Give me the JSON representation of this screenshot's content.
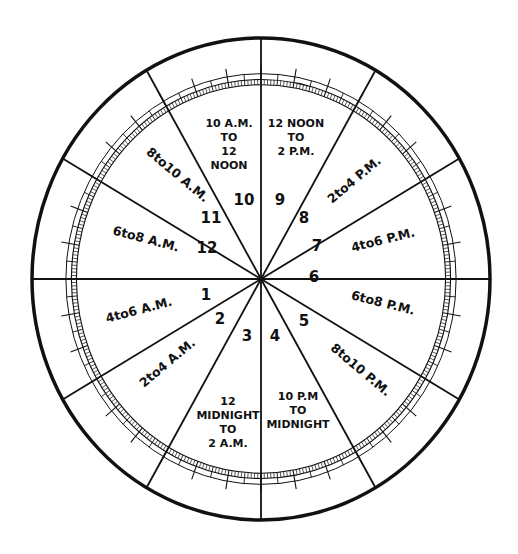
{
  "diagram": {
    "type": "astrological-house-wheel",
    "geometry": {
      "cx": 261,
      "cy": 279,
      "rx": 229,
      "ry": 241,
      "stroke_color": "#111111",
      "background": "#ffffff"
    },
    "houses": [
      {
        "number": "1",
        "time_lines": [
          "4 TO 6 A.M."
        ],
        "display": "4to6 A.M."
      },
      {
        "number": "2",
        "time_lines": [
          "2 TO 4 A.M."
        ],
        "display": "2to4 A.M."
      },
      {
        "number": "3",
        "time_lines": [
          "12",
          "MIDNIGHT",
          "TO",
          "2 A.M."
        ],
        "display": "12 MIDNIGHT TO 2 A.M."
      },
      {
        "number": "4",
        "time_lines": [
          "10 P.M",
          "TO",
          "MIDNIGHT"
        ],
        "display": "10 P.M TO MIDNIGHT"
      },
      {
        "number": "5",
        "time_lines": [
          "8 TO 10 P.M."
        ],
        "display": "8to10 P.M."
      },
      {
        "number": "6",
        "time_lines": [
          "6 TO 8 P.M."
        ],
        "display": "6to8 P.M."
      },
      {
        "number": "7",
        "time_lines": [
          "4 TO 6 P.M."
        ],
        "display": "4to6 P.M."
      },
      {
        "number": "8",
        "time_lines": [
          "2 TO 4 P.M."
        ],
        "display": "2to4 P.M."
      },
      {
        "number": "9",
        "time_lines": [
          "12 NOON",
          "TO",
          "2 P.M."
        ],
        "display": "12 NOON TO 2 P.M."
      },
      {
        "number": "10",
        "time_lines": [
          "10 A.M.",
          "TO",
          "12",
          "NOON"
        ],
        "display": "10 A.M. TO 12 NOON"
      },
      {
        "number": "11",
        "time_lines": [
          "8 TO 10 A.M."
        ],
        "display": "8to10 A.M."
      },
      {
        "number": "12",
        "time_lines": [
          "6 TO 8 A.M."
        ],
        "display": "6to8 A.M."
      }
    ],
    "labels": {
      "h1": {
        "text": "4to6 A.M.",
        "x": 140,
        "y": 314,
        "rot": -15
      },
      "h2": {
        "text": "2to4 A.M.",
        "x": 170,
        "y": 366,
        "rot": -40
      },
      "h3": {
        "lines": [
          "12",
          "MIDNIGHT",
          "TO",
          "2 A.M."
        ],
        "x": 228,
        "y": 405
      },
      "h4": {
        "lines": [
          "10 P.M",
          "TO",
          "MIDNIGHT"
        ],
        "x": 298,
        "y": 400
      },
      "h5": {
        "text": "8to10 P.M.",
        "x": 358,
        "y": 373,
        "rot": 40
      },
      "h6": {
        "text": "6to8 P.M.",
        "x": 382,
        "y": 307,
        "rot": 14
      },
      "h7": {
        "text": "4to6 P.M.",
        "x": 384,
        "y": 244,
        "rot": -14
      },
      "h8": {
        "text": "2to4 P.M.",
        "x": 357,
        "y": 183,
        "rot": -40
      },
      "h9": {
        "lines": [
          "12 NOON",
          "TO",
          "2 P.M."
        ],
        "x": 296,
        "y": 127
      },
      "h10": {
        "lines": [
          "10 A.M.",
          "TO",
          "12",
          "NOON"
        ],
        "x": 229,
        "y": 127
      },
      "h11": {
        "text": "8to10 A.M.",
        "x": 175,
        "y": 178,
        "rot": 40
      },
      "h12": {
        "text": "6to8 A.M.",
        "x": 145,
        "y": 243,
        "rot": 15
      }
    },
    "house_numbers": [
      {
        "n": "1",
        "x": 206,
        "y": 300
      },
      {
        "n": "2",
        "x": 220,
        "y": 324
      },
      {
        "n": "3",
        "x": 247,
        "y": 341
      },
      {
        "n": "4",
        "x": 275,
        "y": 341
      },
      {
        "n": "5",
        "x": 304,
        "y": 326
      },
      {
        "n": "6",
        "x": 314,
        "y": 282
      },
      {
        "n": "7",
        "x": 317,
        "y": 251
      },
      {
        "n": "8",
        "x": 304,
        "y": 223
      },
      {
        "n": "9",
        "x": 280,
        "y": 205
      },
      {
        "n": "10",
        "x": 244,
        "y": 205
      },
      {
        "n": "11",
        "x": 211,
        "y": 223
      },
      {
        "n": "12",
        "x": 207,
        "y": 253
      }
    ]
  }
}
